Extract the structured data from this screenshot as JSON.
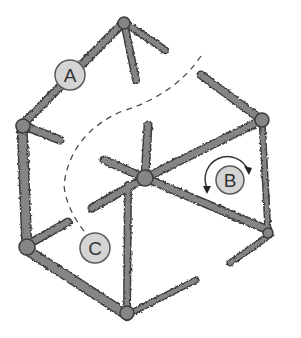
{
  "diagram": {
    "type": "hexagonal lattice / crack network",
    "colors": {
      "background": "#ffffff",
      "network_fill": "#808080",
      "network_stroke": "#3c3c3c",
      "marker_fill": "#d4d4d4",
      "marker_stroke": "#5a5a5a",
      "dashed_path": "#4a4a4a",
      "label_text": "#333333"
    },
    "markers": [
      {
        "id": "A",
        "label": "A",
        "cx": 70,
        "cy": 75,
        "r": 15
      },
      {
        "id": "B",
        "label": "B",
        "cx": 230,
        "cy": 180,
        "r": 14,
        "rotation_arrows": true
      },
      {
        "id": "C",
        "label": "C",
        "cx": 95,
        "cy": 248,
        "r": 15
      }
    ],
    "dashed_path": {
      "from": "upper-right open gap",
      "to": "C",
      "description": "dashed curve passing between upper-left edge and center hub, ending at marker C"
    }
  }
}
